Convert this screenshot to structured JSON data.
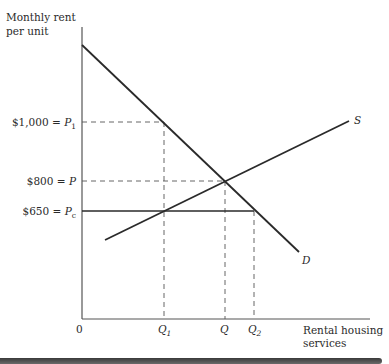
{
  "diagram": {
    "y_axis_label_line1": "Monthly rent",
    "y_axis_label_line2": "per unit",
    "x_axis_label_line1": "Rental housing",
    "x_axis_label_line2": "services",
    "origin_label": "0",
    "price_levels": [
      {
        "amount": "$1,000",
        "symbol": "P",
        "subscript": "1"
      },
      {
        "amount": "$800",
        "symbol": "P",
        "subscript": ""
      },
      {
        "amount": "$650",
        "symbol": "P",
        "subscript": "c"
      }
    ],
    "quantity_levels": [
      {
        "symbol": "Q",
        "subscript": "1"
      },
      {
        "symbol": "Q",
        "subscript": ""
      },
      {
        "symbol": "Q",
        "subscript": "2"
      }
    ],
    "curves": {
      "supply_label": "S",
      "demand_label": "D"
    },
    "colors": {
      "line": "#2a2a2a",
      "dashed": "#555555",
      "background": "#ffffff"
    }
  }
}
